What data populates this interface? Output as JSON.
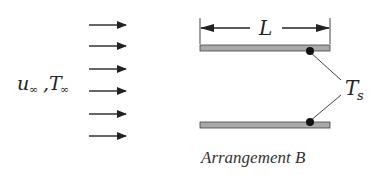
{
  "diagram": {
    "type": "heat-transfer-schematic",
    "free_stream_label": {
      "u": "u",
      "sub_u": "∞",
      "comma": ",",
      "T": "T",
      "sub_T": "∞"
    },
    "flow_arrows": {
      "count": 6,
      "y": [
        25,
        46,
        69,
        91,
        114,
        136
      ],
      "x_start": 89,
      "x_end": 126,
      "color": "#222222"
    },
    "plates": {
      "color": "#a9a9a9",
      "border": "#444444",
      "top": {
        "x": 200,
        "y": 45,
        "width": 130,
        "height": 6
      },
      "bottom": {
        "x": 200,
        "y": 122,
        "width": 130,
        "height": 6
      }
    },
    "length_dimension": {
      "label": "L",
      "y": 28,
      "x_start": 200,
      "x_end": 330
    },
    "surface_temperature": {
      "label": "T",
      "sub": "s"
    },
    "caption": "Arrangement B"
  }
}
